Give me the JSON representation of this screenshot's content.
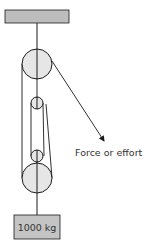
{
  "diagram": {
    "colors": {
      "line": "#1a1a1a",
      "ceiling_fill": "#bdbdbd",
      "pulley_fill": "#e6e6e6",
      "weight_fill": "#c4c4c4",
      "text": "#333333"
    },
    "ceiling": {
      "x": 5,
      "y": 10,
      "w": 64,
      "h": 13
    },
    "pulleys": [
      {
        "name": "top-large",
        "cx": 37,
        "cy": 64,
        "r": 15
      },
      {
        "name": "upper-small",
        "cx": 37,
        "cy": 103,
        "r": 6
      },
      {
        "name": "lower-small",
        "cx": 37,
        "cy": 156,
        "r": 6
      },
      {
        "name": "bottom-large",
        "cx": 37,
        "cy": 178,
        "r": 15
      }
    ],
    "weight": {
      "x": 14,
      "y": 215,
      "w": 46,
      "h": 24,
      "label": "1000 kg"
    },
    "force": {
      "label": "Force or effort",
      "arrow_start": [
        52,
        61
      ],
      "arrow_end": [
        104,
        141
      ]
    }
  }
}
